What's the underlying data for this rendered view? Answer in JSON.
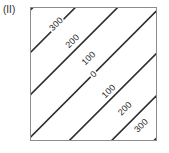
{
  "figure": {
    "panel_label": "(II)",
    "frame_color": "#8c8c8c",
    "line_color": "#2a2a2a",
    "background_color": "#ffffff",
    "label_color": "#1f1f1f"
  },
  "chart_data": {
    "type": "line",
    "chart_kind": "contour",
    "title": "(II)",
    "subtitle": "",
    "xlabel": "",
    "ylabel": "",
    "xlim": [
      0,
      100
    ],
    "ylim": [
      0,
      100
    ],
    "xticks": [],
    "yticks": [],
    "xticklabels": [],
    "yticklabels": [],
    "grid": false,
    "legend": false,
    "legend_position": "none",
    "contour_levels": [
      300,
      200,
      100,
      0,
      100,
      200,
      300
    ],
    "contour_interval": 100,
    "contours": [
      {
        "label": "300",
        "value": 300,
        "side": "upper-left",
        "label_x": 20,
        "label_y": 12,
        "line_offset": -3.0
      },
      {
        "label": "200",
        "value": 200,
        "side": "upper-left",
        "label_x": 33,
        "label_y": 25,
        "line_offset": -2.0
      },
      {
        "label": "100",
        "value": 100,
        "side": "upper-left",
        "label_x": 46,
        "label_y": 38,
        "line_offset": -1.0
      },
      {
        "label": "0",
        "value": 0,
        "side": "center",
        "label_x": 50,
        "label_y": 50,
        "line_offset": 0.0
      },
      {
        "label": "100",
        "value": 100,
        "side": "lower-right",
        "label_x": 62,
        "label_y": 63,
        "line_offset": 1.0
      },
      {
        "label": "200",
        "value": 200,
        "side": "lower-right",
        "label_x": 75,
        "label_y": 76,
        "line_offset": 2.0
      },
      {
        "label": "300",
        "value": 300,
        "side": "lower-right",
        "label_x": 88,
        "label_y": 89,
        "line_offset": 3.0
      }
    ],
    "unlabeled_contours": [
      {
        "line_offset": -4.0
      },
      {
        "line_offset": 4.0
      }
    ],
    "series": [
      {
        "name": "contour 300 (upper-left)",
        "values": [
          300,
          300
        ]
      },
      {
        "name": "contour 200 (upper-left)",
        "values": [
          200,
          200
        ]
      },
      {
        "name": "contour 100 (upper-left)",
        "values": [
          100,
          100
        ]
      },
      {
        "name": "contour 0",
        "values": [
          0,
          0
        ]
      },
      {
        "name": "contour 100 (lower-right)",
        "values": [
          100,
          100
        ]
      },
      {
        "name": "contour 200 (lower-right)",
        "values": [
          200,
          200
        ]
      },
      {
        "name": "contour 300 (lower-right)",
        "values": [
          300,
          300
        ]
      }
    ]
  }
}
